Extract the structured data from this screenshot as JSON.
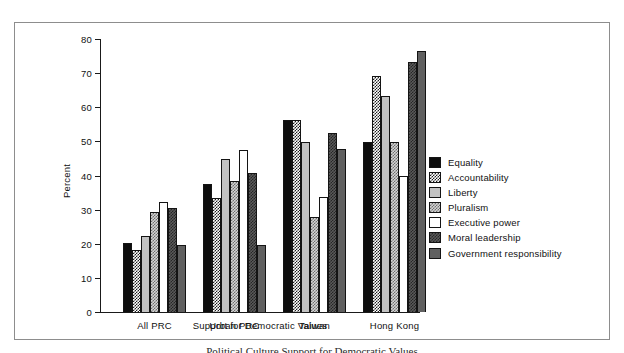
{
  "chart_data": {
    "type": "bar",
    "title": "",
    "xlabel": "Support for Democratic Values",
    "ylabel": "Percent",
    "ylim": [
      0,
      80
    ],
    "yticks": [
      0,
      10,
      20,
      30,
      40,
      50,
      60,
      70,
      80
    ],
    "grid": false,
    "legend_position": "right",
    "categories": [
      "All PRC",
      "Urban PRC",
      "Taiwan",
      "Hong Kong"
    ],
    "series": [
      {
        "name": "Equality",
        "values": [
          20.2,
          37.4,
          56.2,
          49.8
        ]
      },
      {
        "name": "Accountability",
        "values": [
          18.3,
          33.5,
          56.2,
          69.3
        ]
      },
      {
        "name": "Liberty",
        "values": [
          22.2,
          44.7,
          49.8,
          63.4
        ]
      },
      {
        "name": "Pluralism",
        "values": [
          29.3,
          38.5,
          27.9,
          49.9
        ]
      },
      {
        "name": "Executive power",
        "values": [
          32.3,
          47.5,
          33.7,
          39.9
        ]
      },
      {
        "name": "Moral leadership",
        "values": [
          30.5,
          40.7,
          52.4,
          73.4
        ]
      },
      {
        "name": "Government responsibility",
        "values": [
          19.5,
          19.5,
          47.9,
          76.5
        ]
      }
    ]
  },
  "caption": "Political Culture Support for Democratic Values"
}
